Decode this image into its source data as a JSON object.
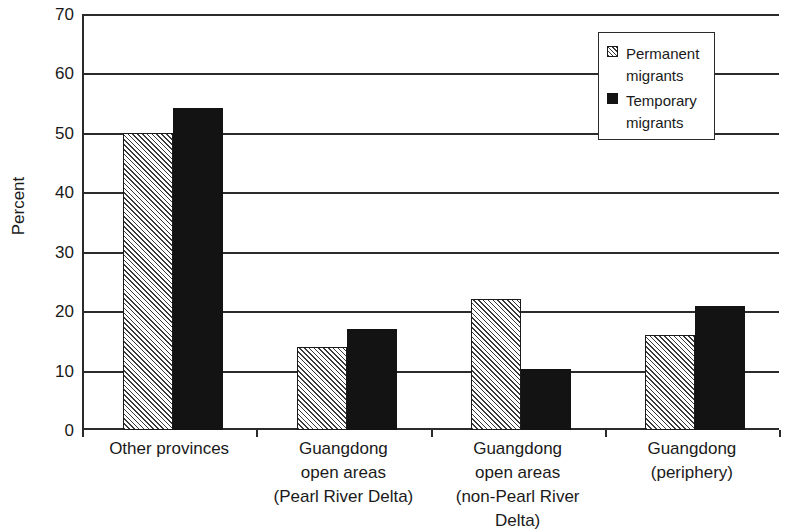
{
  "chart_data": {
    "type": "bar",
    "title": "",
    "subtitle": "",
    "xlabel": "",
    "ylabel": "Percent",
    "ylim": [
      0,
      70
    ],
    "yticks": [
      0,
      10,
      20,
      30,
      40,
      50,
      60,
      70
    ],
    "ytick_labels": [
      "0",
      "10",
      "20",
      "30",
      "40",
      "50",
      "60",
      "70"
    ],
    "grid": "horizontal",
    "legend_position": "top-right",
    "categories": [
      "Other provinces",
      "Guangdong open areas (Pearl River Delta)",
      "Guangdong open areas (non-Pearl River Delta)",
      "Guangdong (periphery)"
    ],
    "category_lines": [
      [
        "Other provinces"
      ],
      [
        "Guangdong",
        "open areas",
        "(Pearl River Delta)"
      ],
      [
        "Guangdong",
        "open areas",
        "(non-Pearl River",
        "Delta)"
      ],
      [
        "Guangdong",
        "(periphery)"
      ]
    ],
    "series": [
      {
        "name": "Permanent migrants",
        "legend_lines": [
          "Permanent",
          "migrants"
        ],
        "fill": "hatched",
        "color": "#f2f2f2",
        "values": [
          50.0,
          14.0,
          22.0,
          16.0
        ]
      },
      {
        "name": "Temporary migrants",
        "legend_lines": [
          "Temporary",
          "migrants"
        ],
        "fill": "solid",
        "color": "#131313",
        "values": [
          54.2,
          17.0,
          10.3,
          20.8
        ]
      }
    ]
  }
}
